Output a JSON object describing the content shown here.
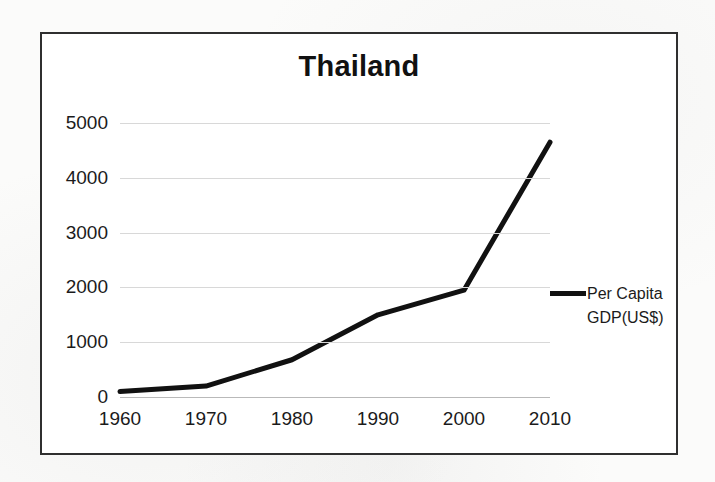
{
  "chart_data": {
    "type": "line",
    "title": "Thailand",
    "xlabel": "",
    "ylabel": "",
    "x": [
      1960,
      1970,
      1980,
      1990,
      2000,
      2010
    ],
    "categories": [
      "1960",
      "1970",
      "1980",
      "1990",
      "2000",
      "2010"
    ],
    "series": [
      {
        "name": "Per Capita GDP(US$)",
        "values": [
          100,
          200,
          680,
          1500,
          1950,
          4650
        ]
      }
    ],
    "xlim": [
      1960,
      2010
    ],
    "ylim": [
      0,
      5000
    ],
    "ytick_labels": [
      "0",
      "1000",
      "2000",
      "3000",
      "4000",
      "5000"
    ],
    "ytick_values": [
      0,
      1000,
      2000,
      3000,
      4000,
      5000
    ],
    "xtick_labels": [
      "1960",
      "1970",
      "1980",
      "1990",
      "2000",
      "2010"
    ],
    "grid": "horizontal",
    "legend_position": "right",
    "legend_entries": [
      "Per Capita GDP(US$)"
    ],
    "line_color": "#111111"
  },
  "legend": {
    "label": "Per Capita GDP(US$)"
  },
  "colors": {
    "line": "#111111",
    "grid": "#d8d8d8",
    "frame": "#2f2f2f",
    "text": "#1b1b1b",
    "plot_background": "#ffffff",
    "page_background": "#fbfbfa"
  }
}
